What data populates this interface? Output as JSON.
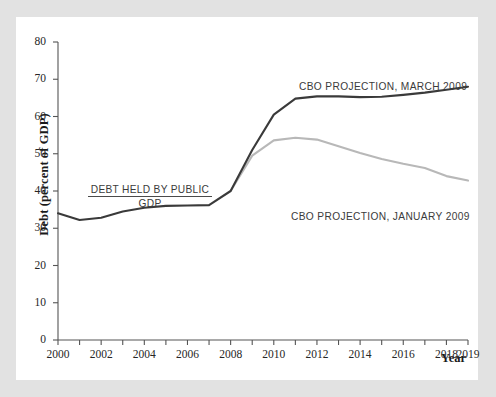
{
  "figure": {
    "background_color": "#e2e2e2",
    "card_color": "#ffffff"
  },
  "chart_data": {
    "type": "line",
    "title": "",
    "xlabel": "Year",
    "ylabel": "Debt (percent of GDP)",
    "xlim": [
      2000,
      2019
    ],
    "ylim": [
      0,
      80
    ],
    "grid": false,
    "legend_position": "inline-annotations",
    "xticks": [
      2000,
      2001,
      2002,
      2003,
      2004,
      2005,
      2006,
      2007,
      2008,
      2009,
      2010,
      2011,
      2012,
      2013,
      2014,
      2015,
      2016,
      2017,
      2018,
      2019
    ],
    "xtick_labels": [
      "2000",
      "",
      "2002",
      "",
      "2004",
      "",
      "2006",
      "",
      "2008",
      "",
      "2010",
      "",
      "2012",
      "",
      "2014",
      "",
      "2016",
      "",
      "2018",
      "2019"
    ],
    "yticks": [
      0,
      10,
      20,
      30,
      40,
      50,
      60,
      70,
      80
    ],
    "ytick_labels": [
      "0",
      "10",
      "20",
      "30",
      "40",
      "50",
      "60",
      "70",
      "80"
    ],
    "series": [
      {
        "name": "CBO PROJECTION, MARCH 2009",
        "color": "#3a3a3a",
        "width": 2.1,
        "x": [
          2000,
          2001,
          2002,
          2003,
          2004,
          2005,
          2006,
          2007,
          2008,
          2009,
          2010,
          2011,
          2012,
          2013,
          2014,
          2015,
          2016,
          2017,
          2018,
          2019
        ],
        "values": [
          34.0,
          32.2,
          32.8,
          34.5,
          35.5,
          36.0,
          36.1,
          36.2,
          40.0,
          51.0,
          60.5,
          64.8,
          65.4,
          65.4,
          65.2,
          65.3,
          65.8,
          66.4,
          67.2,
          68.0
        ]
      },
      {
        "name": "CBO PROJECTION, JANUARY 2009",
        "color": "#b8b8b8",
        "width": 2.1,
        "x": [
          2008,
          2009,
          2010,
          2011,
          2012,
          2013,
          2014,
          2015,
          2016,
          2017,
          2018,
          2019
        ],
        "values": [
          40.0,
          49.5,
          53.6,
          54.3,
          53.8,
          52.0,
          50.2,
          48.6,
          47.3,
          46.2,
          44.0,
          42.8
        ]
      }
    ],
    "annotations": [
      {
        "id": "march-projection-label",
        "text": "CBO PROJECTION, MARCH 2009",
        "x": 2013.2,
        "y": 74.5
      },
      {
        "id": "january-projection-label",
        "text": "CBO PROJECTION, JANUARY 2009",
        "x": 2012.6,
        "y": 39.0
      }
    ],
    "ratio_label": {
      "numerator": "DEBT HELD BY PUBLIC",
      "denominator": "GDP"
    }
  }
}
